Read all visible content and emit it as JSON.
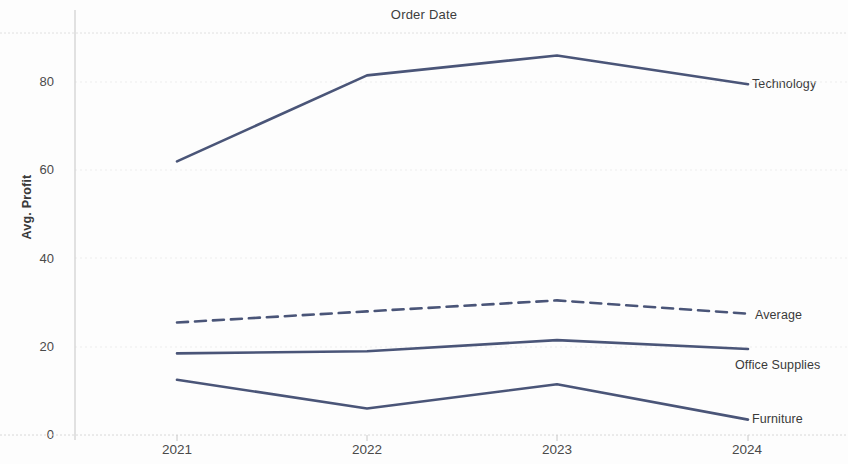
{
  "chart": {
    "title": "Order Date",
    "ylabel": "Avg. Profit"
  },
  "axis": {
    "yticks": [
      "0",
      "20",
      "40",
      "60",
      "80"
    ],
    "xticks": [
      "2021",
      "2022",
      "2023",
      "2024"
    ]
  },
  "labels": {
    "technology": "Technology",
    "average": "Average",
    "office_supplies": "Office Supplies",
    "furniture": "Furniture"
  },
  "colors": {
    "line": "#4a5578",
    "grid": "#e6e6e6",
    "axis": "#d0d0d0",
    "text": "#3d3d3d",
    "background": "#fdfdfd"
  },
  "chart_data": {
    "type": "line",
    "title": "Order Date",
    "xlabel": "Order Date",
    "ylabel": "Avg. Profit",
    "x": [
      "2021",
      "2022",
      "2023",
      "2024"
    ],
    "ylim": [
      0,
      90
    ],
    "yticks": [
      0,
      20,
      40,
      60,
      80
    ],
    "grid": true,
    "legend": "right-end-labels",
    "series": [
      {
        "name": "Technology",
        "values": [
          62,
          81.5,
          86,
          79.5
        ],
        "style": "solid",
        "color": "#4a5578"
      },
      {
        "name": "Average",
        "values": [
          25.5,
          28,
          30.5,
          27.5
        ],
        "style": "dashed",
        "color": "#4a5578"
      },
      {
        "name": "Office Supplies",
        "values": [
          18.5,
          19,
          21.5,
          19.5
        ],
        "style": "solid",
        "color": "#4a5578"
      },
      {
        "name": "Furniture",
        "values": [
          12.5,
          6,
          11.5,
          3.5
        ],
        "style": "solid",
        "color": "#4a5578"
      }
    ]
  }
}
